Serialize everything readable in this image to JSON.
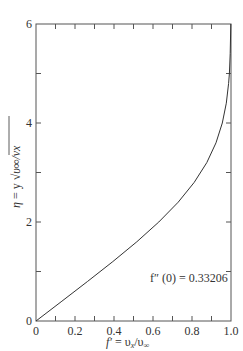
{
  "chart_data": {
    "type": "line",
    "title": "",
    "xlabel": "f′ = υx/υ∞",
    "ylabel": "η = y √(υ∞/νx)",
    "xlim": [
      0,
      1.0
    ],
    "ylim": [
      0,
      6
    ],
    "x_ticks": [
      "0",
      "0.2",
      "0.4",
      "0.6",
      "0.8",
      "1.0"
    ],
    "x_minor_ticks": [
      0.1,
      0.3,
      0.5,
      0.7,
      0.9
    ],
    "y_ticks": [
      "0",
      "2",
      "4",
      "6"
    ],
    "y_minor_ticks": [
      1,
      3,
      5
    ],
    "grid": false,
    "legend": null,
    "annotations": [
      {
        "text": "f″ (0) = 0.33206",
        "x": 0.63,
        "y": 0.9
      }
    ],
    "series": [
      {
        "name": "Blasius profile",
        "x": [
          0,
          0.1328,
          0.2647,
          0.3938,
          0.5168,
          0.6298,
          0.729,
          0.8115,
          0.8761,
          0.9233,
          0.9555,
          0.9759,
          0.9878,
          0.9916,
          0.996,
          0.999
        ],
        "y": [
          0,
          0.4,
          0.8,
          1.2,
          1.6,
          2.0,
          2.4,
          2.8,
          3.2,
          3.6,
          4.0,
          4.4,
          4.8,
          5.0,
          5.4,
          6.0
        ]
      }
    ]
  },
  "labels": {
    "x_axis_f": "f′",
    "x_axis_eq": " = υ",
    "x_axis_sub1": "x",
    "x_axis_slash": "/υ",
    "x_axis_sub2": "∞",
    "y_axis_eta": "η",
    "y_axis_eq": " = y ",
    "y_axis_root": "√",
    "y_axis_inner": "υ∞/νx",
    "annotation": "f″ (0) = 0.33206"
  }
}
